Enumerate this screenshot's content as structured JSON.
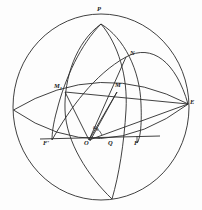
{
  "figure": {
    "type": "geometric-diagram",
    "canvas": {
      "width": 202,
      "height": 210
    },
    "stroke_color": "#2b2b2b",
    "background_color": "#fdfdfd",
    "sphere": {
      "center_x": 101,
      "center_y": 107,
      "radius_x": 88,
      "radius_y": 93
    }
  },
  "labels": {
    "pole": "P",
    "east": "E",
    "node_n": "N",
    "node_m": "M",
    "node_m1_base": "M",
    "node_m1_sub": "1",
    "foot_f": "F",
    "foot_f_prime": "F'",
    "origin": "O",
    "point_q": "Q",
    "angle_base": "a",
    "angle_sub": "0"
  },
  "points": [
    {
      "name": "P",
      "x": 101,
      "y": 24,
      "label_x": 96,
      "label_y": 9
    },
    {
      "name": "E",
      "x": 188,
      "y": 104,
      "label_x": 190,
      "label_y": 101
    },
    {
      "name": "N",
      "x": 126,
      "y": 57,
      "label_x": 130,
      "label_y": 52
    },
    {
      "name": "M",
      "x": 117,
      "y": 92,
      "label_x": 117,
      "label_y": 84
    },
    {
      "name": "M1",
      "x": 65,
      "y": 92,
      "label_x": 55,
      "label_y": 85
    },
    {
      "name": "F",
      "x": 137,
      "y": 140,
      "label_x": 134,
      "label_y": 141
    },
    {
      "name": "F'",
      "x": 52,
      "y": 140,
      "label_x": 44,
      "label_y": 141
    },
    {
      "name": "O",
      "x": 89,
      "y": 140,
      "label_x": 85,
      "label_y": 141
    },
    {
      "name": "Q",
      "x": 111,
      "y": 140,
      "label_x": 108,
      "label_y": 141
    },
    {
      "name": "a0",
      "x": 97,
      "y": 131,
      "label_x": 94,
      "label_y": 126
    }
  ]
}
